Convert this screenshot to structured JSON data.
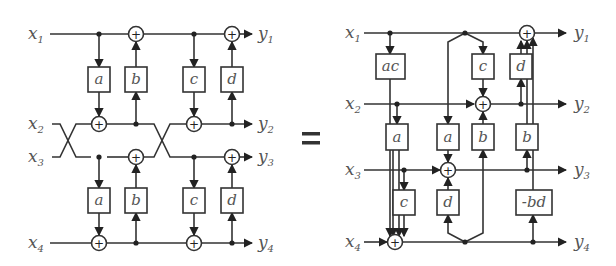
{
  "figure": {
    "equals_sign": "=",
    "left": {
      "inputs": [
        "x1",
        "x2",
        "x3",
        "x4"
      ],
      "outputs": [
        "y1",
        "y2",
        "y3",
        "y4"
      ],
      "upper_blocks": [
        "a",
        "b",
        "c",
        "d"
      ],
      "lower_blocks": [
        "a",
        "b",
        "c",
        "d"
      ],
      "crossings": 2
    },
    "right": {
      "inputs": [
        "x1",
        "x2",
        "x3",
        "x4"
      ],
      "outputs": [
        "y1",
        "y2",
        "y3",
        "y4"
      ],
      "blocks": {
        "ac": "ac",
        "c_top": "c",
        "d_top": "d",
        "a_mid_left": "a",
        "a_mid": "a",
        "b_mid": "b",
        "b_mid_right": "b",
        "c_bottom": "c",
        "d_bottom": "d",
        "neg_bd": "-bd"
      }
    }
  },
  "labels": {
    "x": "x",
    "y": "y",
    "n1": "1",
    "n2": "2",
    "n3": "3",
    "n4": "4",
    "plus": "+"
  }
}
